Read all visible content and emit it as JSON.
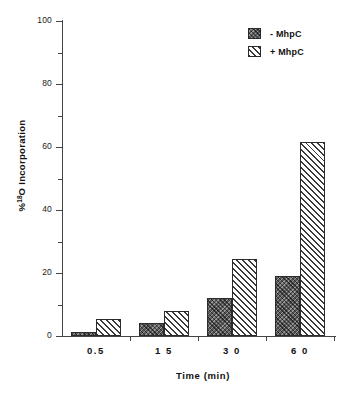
{
  "chart_data": {
    "type": "bar",
    "title": "",
    "subtitle": "",
    "xlabel": "Time  (min)",
    "ylabel": "% 18O Incorporation",
    "ylabel_prefix": "%",
    "ylabel_superscript": "18",
    "ylabel_suffix": "O  Incorporation",
    "categories": [
      "0.5",
      "1 5",
      "3 0",
      "6 0"
    ],
    "categories_value": [
      0.5,
      15,
      30,
      60
    ],
    "series": [
      {
        "name": "-  MhpC",
        "values": [
          1.2,
          4.0,
          12.0,
          19.0
        ]
      },
      {
        "name": "+  MhpC",
        "values": [
          5.5,
          8.0,
          24.5,
          61.5
        ]
      }
    ],
    "ylim": [
      0,
      100
    ],
    "ytick_labels": [
      "0",
      "20",
      "40",
      "60",
      "80",
      "100"
    ],
    "ytick_values": [
      0,
      20,
      40,
      60,
      80,
      100
    ],
    "yminor_values": [
      10,
      30,
      50,
      70,
      90
    ],
    "grid": false,
    "legend_position": "top-right"
  },
  "legend": {
    "items": [
      {
        "label": "-  MhpC",
        "pattern": "dark-crosshatch"
      },
      {
        "label": "+  MhpC",
        "pattern": "diagonal-hatch"
      }
    ]
  },
  "axes": {
    "x_title": "Time  (min)",
    "y_title_parts": {
      "percent": "%",
      "sup": "18",
      "rest": "O  Incorporation"
    }
  }
}
